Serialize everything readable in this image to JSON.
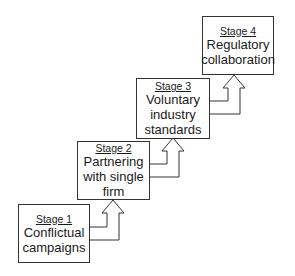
{
  "diagram": {
    "type": "staircase-progression",
    "stages": [
      {
        "label": "Stage 1",
        "lines": [
          "Conflictual",
          "campaigns"
        ]
      },
      {
        "label": "Stage 2",
        "lines": [
          "Partnering",
          "with single",
          "firm"
        ]
      },
      {
        "label": "Stage 3",
        "lines": [
          "Voluntary",
          "industry",
          "standards"
        ]
      },
      {
        "label": "Stage 4",
        "lines": [
          "Regulatory",
          "collaboration"
        ]
      }
    ],
    "connectors": [
      {
        "from": "Stage 1",
        "to": "Stage 2",
        "shape": "hollow-up-arrow"
      },
      {
        "from": "Stage 2",
        "to": "Stage 3",
        "shape": "hollow-up-arrow"
      },
      {
        "from": "Stage 3",
        "to": "Stage 4",
        "shape": "hollow-up-arrow"
      }
    ]
  }
}
